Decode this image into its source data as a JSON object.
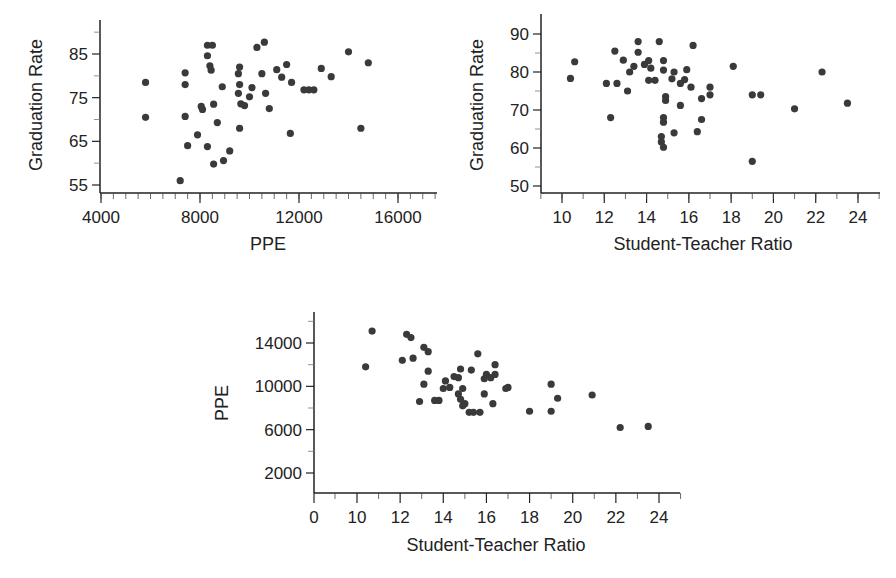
{
  "chart_data": [
    {
      "type": "scatter",
      "title": "",
      "xlabel": "PPE",
      "ylabel": "Graduation Rate",
      "xlim": [
        4000,
        17500
      ],
      "ylim": [
        53,
        93
      ],
      "xticks": [
        4000,
        8000,
        12000,
        16000
      ],
      "yticks": [
        55,
        65,
        75,
        85
      ],
      "x_minor_step": 500,
      "y_minor_step": 5,
      "grid": false,
      "legend": null,
      "points": [
        [
          5800,
          78.5
        ],
        [
          5800,
          70.5
        ],
        [
          7400,
          80.7
        ],
        [
          7400,
          78
        ],
        [
          7400,
          70.7
        ],
        [
          7500,
          64
        ],
        [
          7200,
          56
        ],
        [
          7900,
          66.5
        ],
        [
          8050,
          73
        ],
        [
          8100,
          72.3
        ],
        [
          8300,
          87
        ],
        [
          8300,
          84.6
        ],
        [
          8400,
          82.3
        ],
        [
          8450,
          81.3
        ],
        [
          8500,
          87
        ],
        [
          8550,
          73.5
        ],
        [
          8300,
          63.8
        ],
        [
          8550,
          59.8
        ],
        [
          8700,
          69.3
        ],
        [
          8900,
          77.5
        ],
        [
          8950,
          60.6
        ],
        [
          9200,
          62.8
        ],
        [
          9550,
          80.5
        ],
        [
          9600,
          82
        ],
        [
          9600,
          78
        ],
        [
          9550,
          76
        ],
        [
          9650,
          73.6
        ],
        [
          9800,
          73.2
        ],
        [
          9600,
          68
        ],
        [
          10000,
          75.2
        ],
        [
          10100,
          77.3
        ],
        [
          10300,
          86.5
        ],
        [
          10500,
          80.5
        ],
        [
          10600,
          87.7
        ],
        [
          10650,
          76
        ],
        [
          10800,
          72.5
        ],
        [
          11100,
          81.4
        ],
        [
          11300,
          79.7
        ],
        [
          11500,
          82.6
        ],
        [
          11700,
          78.5
        ],
        [
          11650,
          66.8
        ],
        [
          12200,
          76.8
        ],
        [
          12400,
          76.8
        ],
        [
          12600,
          76.8
        ],
        [
          12900,
          81.7
        ],
        [
          13300,
          79.8
        ],
        [
          14000,
          85.5
        ],
        [
          14500,
          68
        ],
        [
          14800,
          83
        ]
      ]
    },
    {
      "type": "scatter",
      "title": "",
      "xlabel": "Student-Teacher Ratio",
      "ylabel": "Graduation Rate",
      "xlim": [
        9,
        25
      ],
      "ylim": [
        48,
        94
      ],
      "xticks": [
        10,
        12,
        14,
        16,
        18,
        20,
        22,
        24
      ],
      "yticks": [
        50,
        60,
        70,
        80,
        90
      ],
      "x_minor_step": 1,
      "y_minor_step": 5,
      "grid": false,
      "legend": null,
      "points": [
        [
          10.4,
          78.3
        ],
        [
          10.6,
          82.7
        ],
        [
          12.1,
          77
        ],
        [
          12.3,
          68
        ],
        [
          12.5,
          85.5
        ],
        [
          12.6,
          77
        ],
        [
          12.9,
          83.1
        ],
        [
          13.1,
          75
        ],
        [
          13.2,
          80
        ],
        [
          13.4,
          81.5
        ],
        [
          13.6,
          88
        ],
        [
          13.6,
          85.2
        ],
        [
          13.9,
          82
        ],
        [
          14.1,
          83
        ],
        [
          14.1,
          77.8
        ],
        [
          14.2,
          81
        ],
        [
          14.4,
          77.8
        ],
        [
          14.6,
          88
        ],
        [
          14.8,
          83
        ],
        [
          14.8,
          80.5
        ],
        [
          14.9,
          73.5
        ],
        [
          14.9,
          72.5
        ],
        [
          14.8,
          68
        ],
        [
          14.8,
          66.8
        ],
        [
          14.7,
          63
        ],
        [
          14.7,
          61.6
        ],
        [
          14.8,
          60.2
        ],
        [
          15.2,
          78.2
        ],
        [
          15.3,
          80
        ],
        [
          15.3,
          64
        ],
        [
          15.6,
          77
        ],
        [
          15.6,
          71.2
        ],
        [
          15.8,
          78
        ],
        [
          15.9,
          80.6
        ],
        [
          16.1,
          76
        ],
        [
          16.2,
          87
        ],
        [
          16.4,
          64.3
        ],
        [
          16.6,
          73
        ],
        [
          16.6,
          67.5
        ],
        [
          17,
          76
        ],
        [
          17,
          74
        ],
        [
          18.1,
          81.5
        ],
        [
          19,
          74
        ],
        [
          19,
          56.5
        ],
        [
          19.4,
          74
        ],
        [
          21,
          70.3
        ],
        [
          22.3,
          80
        ],
        [
          23.5,
          71.8
        ]
      ]
    },
    {
      "type": "scatter",
      "title": "",
      "xlabel": "Student-Teacher Ratio",
      "ylabel": "PPE",
      "xlim": [
        0,
        25
      ],
      "ylim": [
        0,
        16500
      ],
      "xticks": [
        0,
        10,
        12,
        14,
        16,
        18,
        20,
        22,
        24
      ],
      "yticks": [
        2000,
        6000,
        10000,
        14000
      ],
      "x_axis_break": [
        0,
        10
      ],
      "grid": false,
      "legend": null,
      "points": [
        [
          10.4,
          11800
        ],
        [
          10.7,
          15100
        ],
        [
          12.1,
          12400
        ],
        [
          12.3,
          14800
        ],
        [
          12.5,
          14500
        ],
        [
          12.6,
          12600
        ],
        [
          12.9,
          8600
        ],
        [
          13.1,
          13600
        ],
        [
          13.1,
          10200
        ],
        [
          13.3,
          13200
        ],
        [
          13.3,
          11400
        ],
        [
          13.6,
          8700
        ],
        [
          13.8,
          8700
        ],
        [
          14,
          9800
        ],
        [
          14.1,
          10500
        ],
        [
          14.3,
          9900
        ],
        [
          14.5,
          10900
        ],
        [
          14.7,
          10800
        ],
        [
          14.7,
          9300
        ],
        [
          14.8,
          11600
        ],
        [
          14.8,
          8800
        ],
        [
          14.9,
          9800
        ],
        [
          14.9,
          8200
        ],
        [
          15,
          8400
        ],
        [
          15.2,
          7600
        ],
        [
          15.3,
          11500
        ],
        [
          15.4,
          7600
        ],
        [
          15.6,
          13000
        ],
        [
          15.7,
          7600
        ],
        [
          15.9,
          10700
        ],
        [
          15.9,
          9300
        ],
        [
          16,
          11100
        ],
        [
          16.2,
          10800
        ],
        [
          16.3,
          8400
        ],
        [
          16.4,
          11100
        ],
        [
          16.4,
          12000
        ],
        [
          16.9,
          9800
        ],
        [
          17,
          9900
        ],
        [
          18,
          7700
        ],
        [
          19,
          10200
        ],
        [
          19,
          7700
        ],
        [
          19.3,
          8900
        ],
        [
          20.9,
          9200
        ],
        [
          22.2,
          6200
        ],
        [
          23.5,
          6300
        ]
      ]
    }
  ]
}
